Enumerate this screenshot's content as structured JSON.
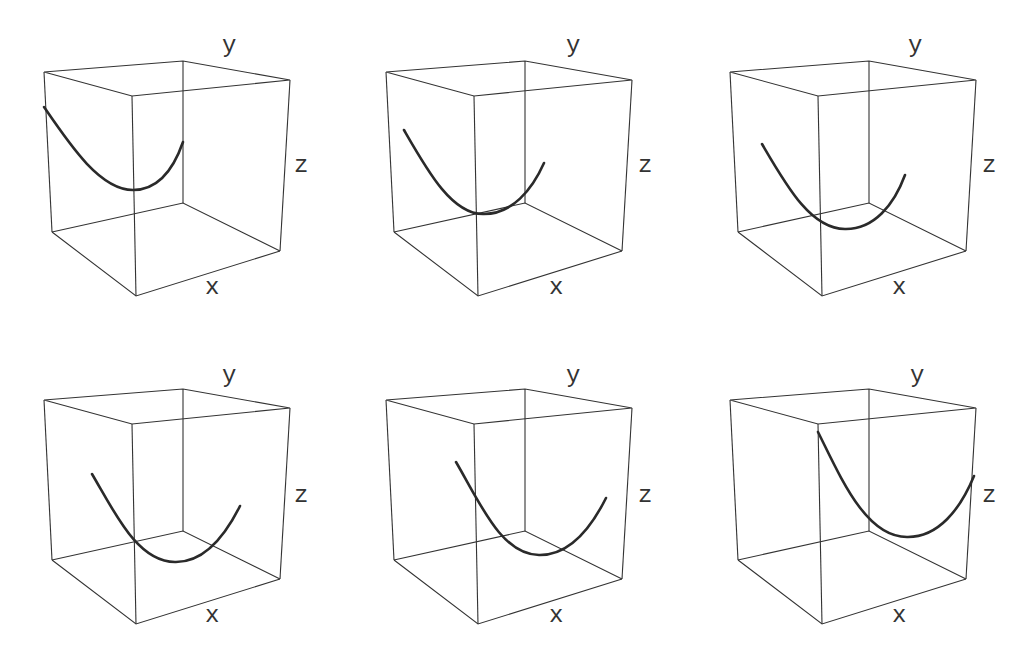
{
  "figure": {
    "panels": [
      {
        "id": "panel-1",
        "row": 0,
        "col": 0,
        "labels": {
          "x": "x",
          "y": "y",
          "z": "z"
        }
      },
      {
        "id": "panel-2",
        "row": 0,
        "col": 1,
        "labels": {
          "x": "x",
          "y": "y",
          "z": "z"
        }
      },
      {
        "id": "panel-3",
        "row": 0,
        "col": 2,
        "labels": {
          "x": "x",
          "y": "y",
          "z": "z"
        }
      },
      {
        "id": "panel-4",
        "row": 1,
        "col": 0,
        "labels": {
          "x": "x",
          "y": "y",
          "z": "z"
        }
      },
      {
        "id": "panel-5",
        "row": 1,
        "col": 1,
        "labels": {
          "x": "x",
          "y": "y",
          "z": "z"
        }
      },
      {
        "id": "panel-6",
        "row": 1,
        "col": 2,
        "labels": {
          "x": "x",
          "y": "y",
          "z": "z"
        }
      }
    ],
    "colors": {
      "edge": "#333333",
      "curve": "#2a2a2a",
      "background": "#ffffff"
    }
  }
}
